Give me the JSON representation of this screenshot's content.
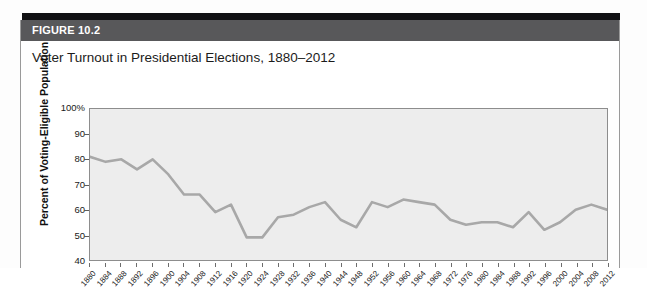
{
  "figure": {
    "number_label": "FIGURE 10.2",
    "title": "Voter Turnout in Presidential Elections, 1880–2012"
  },
  "colors": {
    "banner_background": "#58585a",
    "banner_text": "#ffffff",
    "top_rule": "#111114",
    "plot_background": "#ededed",
    "plot_border": "#8d8d8d",
    "line": "#a8a8a8",
    "axis_text": "#1a1a1a",
    "card_background": "#ffffff"
  },
  "chart_data": {
    "type": "line",
    "title": "Voter Turnout in Presidential Elections, 1880–2012",
    "xlabel": "",
    "ylabel": "Percent of Voting-Eligible Population",
    "ylim": [
      40,
      100
    ],
    "xlim": [
      1880,
      2012
    ],
    "grid": false,
    "legend": "none",
    "y_ticks": [
      40,
      50,
      60,
      70,
      80,
      90,
      100
    ],
    "y_tick_labels": [
      "40",
      "50",
      "60",
      "70",
      "80",
      "90",
      "100%"
    ],
    "categories": [
      "1880",
      "1884",
      "1888",
      "1892",
      "1896",
      "1900",
      "1904",
      "1908",
      "1912",
      "1916",
      "1920",
      "1924",
      "1928",
      "1932",
      "1936",
      "1940",
      "1944",
      "1948",
      "1952",
      "1956",
      "1960",
      "1964",
      "1968",
      "1972",
      "1976",
      "1980",
      "1984",
      "1988",
      "1992",
      "1996",
      "2000",
      "2004",
      "2008",
      "2012"
    ],
    "values": [
      81,
      79,
      80,
      76,
      80,
      74,
      66,
      66,
      59,
      62,
      49,
      49,
      57,
      58,
      61,
      63,
      56,
      53,
      63,
      61,
      64,
      63,
      62,
      56,
      54,
      55,
      55,
      53,
      59,
      52,
      55,
      60,
      62,
      60
    ],
    "series": [
      {
        "name": "Voter turnout",
        "values": [
          81,
          79,
          80,
          76,
          80,
          74,
          66,
          66,
          59,
          62,
          49,
          49,
          57,
          58,
          61,
          63,
          56,
          53,
          63,
          61,
          64,
          63,
          62,
          56,
          54,
          55,
          55,
          53,
          59,
          52,
          55,
          60,
          62,
          60
        ]
      }
    ]
  }
}
